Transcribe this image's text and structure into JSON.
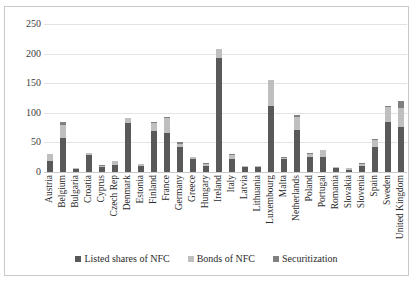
{
  "chart_data": {
    "type": "bar",
    "stacked": true,
    "title": "",
    "subtitle": "",
    "xlabel": "",
    "ylabel": "",
    "ylim": [
      0,
      250
    ],
    "ytick_labels": [
      "250",
      "200",
      "150",
      "100",
      "50",
      "0"
    ],
    "ytick_values": [
      250,
      200,
      150,
      100,
      50,
      0
    ],
    "grid": true,
    "legend_position": "bottom",
    "categories": [
      "Austria",
      "Belgium",
      "Bulgaria",
      "Croatia",
      "Cyprus",
      "Czech Rep",
      "Denmark",
      "Estonia",
      "Finland",
      "France",
      "Germany",
      "Greece",
      "Hungary",
      "Ireland",
      "Italy",
      "Latvia",
      "Lithuania",
      "Luxembourg",
      "Malta",
      "Netherlands",
      "Poland",
      "Portugal",
      "Romania",
      "Slovakia",
      "Slovenia",
      "Spain",
      "Sweden",
      "United Kingdom"
    ],
    "series": [
      {
        "name": "Listed shares of NFC",
        "color": "#595959",
        "values": [
          19,
          57,
          5,
          29,
          8,
          12,
          82,
          11,
          69,
          66,
          42,
          22,
          11,
          193,
          22,
          8,
          8,
          111,
          22,
          71,
          26,
          25,
          6,
          4,
          11,
          43,
          85,
          76
        ]
      },
      {
        "name": "Bonds of NFC",
        "color": "#bfbfbf",
        "values": [
          11,
          23,
          2,
          3,
          3,
          6,
          9,
          2,
          14,
          25,
          6,
          3,
          3,
          14,
          6,
          2,
          2,
          44,
          2,
          22,
          5,
          12,
          2,
          2,
          3,
          11,
          24,
          32
        ]
      },
      {
        "name": "Securitization",
        "color": "#808080",
        "values": [
          1,
          5,
          0,
          1,
          1,
          1,
          1,
          1,
          2,
          2,
          2,
          1,
          1,
          1,
          2,
          1,
          1,
          1,
          1,
          3,
          1,
          1,
          1,
          1,
          1,
          2,
          3,
          12
        ]
      }
    ],
    "legend": [
      {
        "label": "Listed shares of NFC",
        "color": "#595959"
      },
      {
        "label": "Bonds of NFC",
        "color": "#bfbfbf"
      },
      {
        "label": "Securitization",
        "color": "#808080"
      }
    ]
  }
}
